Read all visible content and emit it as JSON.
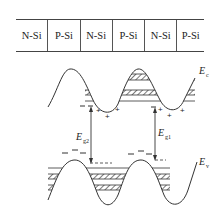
{
  "layers": {
    "cells": [
      {
        "label": "N-Si"
      },
      {
        "label": "P-Si"
      },
      {
        "label": "N-Si"
      },
      {
        "label": "P-Si"
      },
      {
        "label": "N-Si"
      },
      {
        "label": "P-Si"
      }
    ]
  },
  "bands": {
    "conduction": {
      "symbol": "E",
      "subscript": "c"
    },
    "valence": {
      "symbol": "E",
      "subscript": "v"
    }
  },
  "gaps": [
    {
      "symbol": "E",
      "subscript": "g2"
    },
    {
      "symbol": "E",
      "subscript": "g1"
    }
  ],
  "charges": {
    "electron": "–",
    "hole": "+"
  },
  "colors": {
    "line": "#333333",
    "hatch": "#333333",
    "background": "#ffffff"
  }
}
